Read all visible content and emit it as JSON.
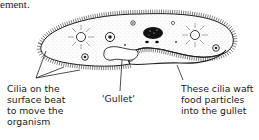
{
  "header_fragment": "ement.",
  "figure": {
    "labels": {
      "cilia_surface": "Cilia on the\nsurface beat\nto move the\norganism",
      "gullet": "'Gullet'",
      "gullet_cilia": "These cilia waft\nfood particles\ninto the gullet"
    }
  }
}
